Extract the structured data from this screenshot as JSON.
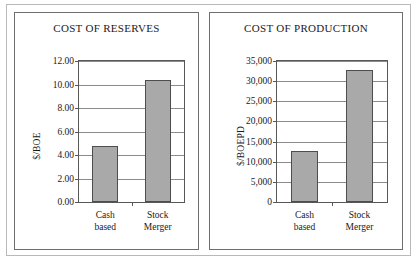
{
  "page": {
    "background_color": "#ffffff",
    "frame_color": "#b9b9b9"
  },
  "panels": [
    {
      "id": "reserves",
      "title": "COST OF RESERVES"
    },
    {
      "id": "production",
      "title": "COST OF PRODUCTION"
    }
  ],
  "chart_data": [
    {
      "type": "bar",
      "title": "COST OF RESERVES",
      "xlabel": "",
      "ylabel": "$/BOE",
      "categories": [
        "Cash based",
        "Stock Merger"
      ],
      "category_lines": [
        [
          "Cash",
          "based"
        ],
        [
          "Stock",
          "Merger"
        ]
      ],
      "values": [
        4.75,
        10.35
      ],
      "ylim": [
        0,
        12
      ],
      "ytick_values": [
        0,
        2,
        4,
        6,
        8,
        10,
        12
      ],
      "ytick_labels": [
        "0.00",
        "2.00",
        "4.00",
        "6.00",
        "8.00",
        "10.00",
        "12.00"
      ],
      "grid": true,
      "legend": false,
      "bar_color": "#a9a9a9",
      "bar_border_color": "#4d4d4d"
    },
    {
      "type": "bar",
      "title": "COST OF PRODUCTION",
      "xlabel": "",
      "ylabel": "$/BOEPD",
      "categories": [
        "Cash based",
        "Stock Merger"
      ],
      "category_lines": [
        [
          "Cash",
          "based"
        ],
        [
          "Stock",
          "Merger"
        ]
      ],
      "values": [
        12700,
        32700
      ],
      "ylim": [
        0,
        35000
      ],
      "ytick_values": [
        0,
        5000,
        10000,
        15000,
        20000,
        25000,
        30000,
        35000
      ],
      "ytick_labels": [
        "0",
        "5,000",
        "10,000",
        "15,000",
        "20,000",
        "25,000",
        "30,000",
        "35,000"
      ],
      "grid": true,
      "legend": false,
      "bar_color": "#a9a9a9",
      "bar_border_color": "#4d4d4d"
    }
  ]
}
